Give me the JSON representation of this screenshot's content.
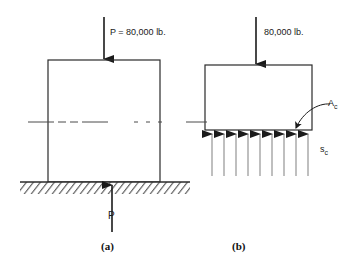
{
  "figure": {
    "background_color": "#ffffff",
    "line_color": "#2a2a2a",
    "text_color": "#1a1a1a",
    "width": 358,
    "height": 266
  },
  "panel_a": {
    "caption": "(a)",
    "load_label": "P = 80,000 lb.",
    "reaction_label": "P",
    "column": {
      "x": 48,
      "y": 60,
      "width": 112,
      "height": 122
    },
    "ground": {
      "x": 20,
      "y": 182,
      "width": 170,
      "height": 12,
      "hatch_label": "ground-hatching"
    },
    "load_arrow": {
      "x": 104,
      "y_start": 17,
      "y_end": 60,
      "direction": "down"
    },
    "reaction_arrow": {
      "x": 112,
      "y_start": 232,
      "y_end": 184,
      "direction": "up"
    },
    "centerline_y": 122
  },
  "panel_b": {
    "caption": "(b)",
    "load_label": "80,000 lb.",
    "area_label": "A",
    "area_label_sub": "c",
    "stress_label": "s",
    "stress_label_sub": "c",
    "column": {
      "x": 205,
      "y": 65,
      "width": 107,
      "height": 65
    },
    "load_arrow": {
      "x": 256,
      "y_start": 17,
      "y_end": 65,
      "direction": "down"
    },
    "centerline_y": 122,
    "stress_arrow_count": 9,
    "stress_arrows": {
      "x_start": 212,
      "x_end": 308,
      "y_top": 131,
      "y_bottom": 176,
      "direction": "up"
    },
    "leader": {
      "from_x": 332,
      "from_y": 104,
      "to_x": 296,
      "to_y": 129,
      "style": "curved-arrow"
    }
  },
  "labels": {
    "units": "lb.",
    "load_value": "80,000"
  }
}
